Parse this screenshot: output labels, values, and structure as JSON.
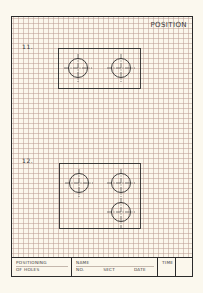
{
  "sheet": {
    "title": "POSITION",
    "figures": [
      {
        "label": "11.",
        "holes": 2
      },
      {
        "label": "12.",
        "holes": 3
      }
    ]
  },
  "title_block": {
    "subject_line1": "POSITIONING",
    "subject_line2": "OF HOLES",
    "name_label": "NAME",
    "no_label": "NO.",
    "sect_label": "SECT",
    "date_label": "DATE",
    "time_label": "TIME"
  },
  "colors": {
    "paper": "#fbf8ee",
    "grid": "#bea096",
    "ink": "#2b2b2b"
  }
}
